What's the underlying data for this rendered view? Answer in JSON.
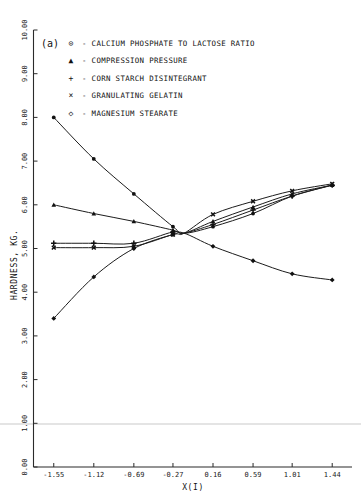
{
  "figure": {
    "panel_label": "(a)",
    "background_color": "#ffffff",
    "ink_color": "#1c1c1c"
  },
  "legend": {
    "position": "top-left-inside",
    "entries": [
      {
        "symbol": "circle-dot",
        "glyph": "⊙",
        "separator": "-",
        "label": "CALCIUM PHOSPHATE TO LACTOSE RATIO"
      },
      {
        "symbol": "triangle",
        "glyph": "▲",
        "separator": "-",
        "label": "COMPRESSION PRESSURE"
      },
      {
        "symbol": "plus",
        "glyph": "+",
        "separator": "-",
        "label": "CORN STARCH DISINTEGRANT"
      },
      {
        "symbol": "times",
        "glyph": "×",
        "separator": "-",
        "label": "GRANULATING GELATIN"
      },
      {
        "symbol": "diamond",
        "glyph": "◇",
        "separator": "-",
        "label": "MAGNESIUM STEARATE"
      }
    ]
  },
  "chart_data": {
    "type": "line",
    "title": "",
    "subtitle": "",
    "xlabel": "X(I)",
    "ylabel": "HARDNESS, KG.",
    "xlim": [
      -1.7675,
      1.6525
    ],
    "ylim": [
      0.0,
      10.0
    ],
    "grid": false,
    "legend_position": "upper-left",
    "xticks": [
      -1.55,
      -1.12,
      -0.69,
      -0.27,
      0.16,
      0.59,
      1.01,
      1.44
    ],
    "xtick_labels": [
      "-1.55",
      "-1.12",
      "-0.69",
      "-0.27",
      "0.16",
      "0.59",
      "1.01",
      "1.44"
    ],
    "yticks": [
      0.0,
      1.0,
      2.0,
      3.0,
      4.0,
      5.0,
      6.0,
      7.0,
      8.0,
      9.0,
      10.0
    ],
    "ytick_labels": [
      "0.00",
      "1.00",
      "2.00",
      "3.00",
      "4.00",
      "5.00",
      "6.00",
      "7.00",
      "8.00",
      "9.00",
      "10.00"
    ],
    "convergence_point": {
      "x": -0.15,
      "y": 5.35
    },
    "series": [
      {
        "name": "CALCIUM PHOSPHATE TO LACTOSE RATIO",
        "marker": "circle-dot",
        "x": [
          -1.55,
          -1.12,
          -0.69,
          -0.27,
          0.16,
          0.59,
          1.01,
          1.44
        ],
        "y": [
          8.0,
          7.05,
          6.25,
          5.5,
          5.5,
          5.8,
          6.2,
          6.45
        ]
      },
      {
        "name": "COMPRESSION PRESSURE",
        "marker": "triangle",
        "x": [
          -1.55,
          -1.12,
          -0.69,
          -0.27,
          0.16,
          0.59,
          1.01,
          1.44
        ],
        "y": [
          6.0,
          5.8,
          5.62,
          5.42,
          5.62,
          5.95,
          6.25,
          6.45
        ]
      },
      {
        "name": "CORN STARCH DISINTEGRANT",
        "marker": "plus",
        "x": [
          -1.55,
          -1.12,
          -0.69,
          -0.27,
          0.16,
          0.59,
          1.01,
          1.44
        ],
        "y": [
          5.12,
          5.12,
          5.12,
          5.38,
          5.55,
          5.88,
          6.2,
          6.45
        ]
      },
      {
        "name": "GRANULATING GELATIN",
        "marker": "times",
        "x": [
          -1.55,
          -1.12,
          -0.69,
          -0.27,
          0.16,
          0.59,
          1.01,
          1.44
        ],
        "y": [
          5.02,
          5.02,
          5.05,
          5.32,
          5.78,
          6.08,
          6.32,
          6.48
        ]
      },
      {
        "name": "MAGNESIUM STEARATE",
        "marker": "diamond",
        "x": [
          -1.55,
          -1.12,
          -0.69,
          -0.27,
          0.16,
          0.59,
          1.01,
          1.44
        ],
        "y": [
          3.4,
          4.35,
          5.0,
          5.32,
          5.05,
          4.72,
          4.42,
          4.28
        ]
      }
    ]
  }
}
